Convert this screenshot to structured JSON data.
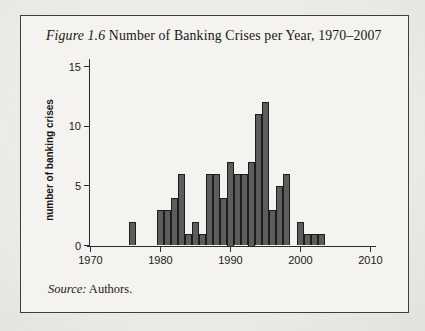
{
  "figure": {
    "title_prefix": "Figure 1.6",
    "title_rest": " Number of Banking Crises per Year, 1970–2007",
    "source_prefix": "Source:",
    "source_rest": " Authors."
  },
  "chart_data": {
    "type": "bar",
    "title": "Figure 1.6 Number of Banking Crises per Year, 1970–2007",
    "xlabel": "",
    "ylabel": "number of banking crises",
    "source": "Source: Authors.",
    "x_tick_labels": [
      "1970",
      "1980",
      "1990",
      "2000",
      "2010"
    ],
    "y_tick_labels": [
      "0",
      "5",
      "10",
      "15"
    ],
    "y_ticks": [
      0,
      5,
      10,
      15
    ],
    "x_ticks": [
      1970,
      1980,
      1990,
      2000,
      2010
    ],
    "ylim": [
      0,
      15
    ],
    "xlim": [
      1967,
      2010
    ],
    "grid": false,
    "legend": "none",
    "years": [
      1970,
      1971,
      1972,
      1973,
      1974,
      1975,
      1976,
      1977,
      1978,
      1979,
      1980,
      1981,
      1982,
      1983,
      1984,
      1985,
      1986,
      1987,
      1988,
      1989,
      1990,
      1991,
      1992,
      1993,
      1994,
      1995,
      1996,
      1997,
      1998,
      1999,
      2000,
      2001,
      2002,
      2003,
      2004,
      2005,
      2006,
      2007
    ],
    "values": [
      0,
      0,
      0,
      0,
      0,
      0,
      2,
      0,
      0,
      0,
      3,
      3,
      4,
      6,
      1,
      2,
      1,
      6,
      6,
      4,
      7,
      6,
      6,
      7,
      11,
      12,
      3,
      5,
      6,
      0,
      2,
      1,
      1,
      1,
      0,
      0,
      0,
      0
    ],
    "bar_color": "#5d5d5d",
    "bar_border_color": "#1d1d1d",
    "axis_color": "#2b2b2b",
    "text_color": "#1a1a1a"
  }
}
